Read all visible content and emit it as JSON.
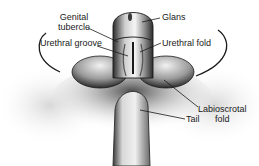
{
  "figure": {
    "type": "anatomical-illustration",
    "labels": {
      "genital_tubercle_line1": "Genital",
      "genital_tubercle_line2": "tubercle",
      "urethral_groove": "Urethral groove",
      "glans": "Glans",
      "urethral_fold": "Urethral fold",
      "labioscrotal_fold_line1": "Labioscrotal",
      "labioscrotal_fold_line2": "fold",
      "tail": "Tail"
    },
    "colors": {
      "ink": "#1a1a1a",
      "shade_dark": "#2b2b2b",
      "shade_mid": "#7a7a7a",
      "shade_light": "#cfcfcf",
      "background": "#ffffff"
    }
  }
}
